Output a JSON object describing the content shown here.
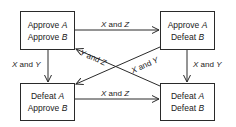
{
  "states": [
    {
      "id": "tl",
      "line1": "Approve",
      "var1": "A",
      "line2": "Approve",
      "var2": "B"
    },
    {
      "id": "tr",
      "line1": "Approve",
      "var1": "A",
      "line2": "Defeat",
      "var2": "B"
    },
    {
      "id": "bl",
      "line1": "Defeat",
      "var1": "A",
      "line2": "Approve",
      "var2": "B"
    },
    {
      "id": "br",
      "line1": "Defeat",
      "var1": "A",
      "line2": "Defeat",
      "var2": "B"
    }
  ],
  "transitions": [
    {
      "from": "tl",
      "to": "tr",
      "a": "X",
      "and": "and",
      "b": "Z"
    },
    {
      "from": "tl",
      "to": "bl",
      "a": "X",
      "and": "and",
      "b": "Y"
    },
    {
      "from": "tr",
      "to": "br",
      "a": "X",
      "and": "and",
      "b": "Y"
    },
    {
      "from": "bl",
      "to": "br",
      "a": "X",
      "and": "and",
      "b": "Z"
    },
    {
      "from": "br",
      "to": "tl",
      "a": "Y",
      "and": "and",
      "b": "Z"
    },
    {
      "from": "tr",
      "to": "bl",
      "a": "X",
      "and": "and",
      "b": "Y"
    }
  ]
}
